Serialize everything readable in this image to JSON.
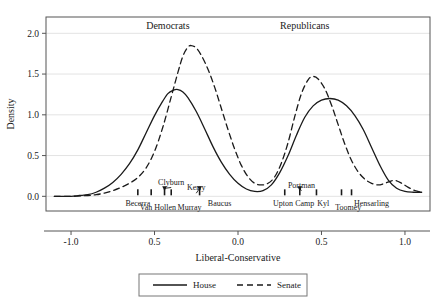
{
  "chart_data": {
    "type": "line",
    "title": "",
    "xlabel": "Liberal-Conservative",
    "ylabel": "Density",
    "xlim": [
      -1.15,
      1.15
    ],
    "ylim": [
      -0.18,
      2.2
    ],
    "grid": true,
    "legend_position": "bottom",
    "xticks": [
      -1.0,
      -0.5,
      0.0,
      0.5,
      1.0
    ],
    "xtick_labels": [
      "-1.0",
      "0.5",
      "0.0",
      "0.5",
      "1.0"
    ],
    "yticks": [
      0.0,
      0.5,
      1.0,
      1.5,
      2.0
    ],
    "ytick_labels": [
      "0.0",
      "0.5",
      "1.0",
      "1.5",
      "2.0"
    ],
    "panel_titles": [
      "Democrats",
      "Republicans"
    ],
    "series": [
      {
        "name": "House",
        "style": "solid",
        "color": "#1a1a1a",
        "points": [
          [
            -1.1,
            0.0
          ],
          [
            -1.0,
            0.0
          ],
          [
            -0.95,
            0.01
          ],
          [
            -0.9,
            0.02
          ],
          [
            -0.85,
            0.05
          ],
          [
            -0.8,
            0.1
          ],
          [
            -0.75,
            0.17
          ],
          [
            -0.7,
            0.27
          ],
          [
            -0.65,
            0.4
          ],
          [
            -0.6,
            0.57
          ],
          [
            -0.55,
            0.78
          ],
          [
            -0.5,
            0.99
          ],
          [
            -0.45,
            1.17
          ],
          [
            -0.42,
            1.26
          ],
          [
            -0.39,
            1.3
          ],
          [
            -0.36,
            1.31
          ],
          [
            -0.33,
            1.28
          ],
          [
            -0.3,
            1.21
          ],
          [
            -0.25,
            1.04
          ],
          [
            -0.2,
            0.83
          ],
          [
            -0.15,
            0.61
          ],
          [
            -0.1,
            0.42
          ],
          [
            -0.05,
            0.27
          ],
          [
            0.0,
            0.16
          ],
          [
            0.05,
            0.09
          ],
          [
            0.1,
            0.06
          ],
          [
            0.15,
            0.07
          ],
          [
            0.2,
            0.14
          ],
          [
            0.25,
            0.29
          ],
          [
            0.3,
            0.5
          ],
          [
            0.35,
            0.75
          ],
          [
            0.4,
            0.97
          ],
          [
            0.45,
            1.11
          ],
          [
            0.5,
            1.18
          ],
          [
            0.55,
            1.2
          ],
          [
            0.6,
            1.18
          ],
          [
            0.65,
            1.11
          ],
          [
            0.7,
            0.99
          ],
          [
            0.75,
            0.82
          ],
          [
            0.8,
            0.6
          ],
          [
            0.85,
            0.38
          ],
          [
            0.9,
            0.2
          ],
          [
            0.95,
            0.1
          ],
          [
            1.0,
            0.06
          ],
          [
            1.05,
            0.05
          ],
          [
            1.1,
            0.05
          ]
        ]
      },
      {
        "name": "Senate",
        "style": "dashed",
        "color": "#1a1a1a",
        "points": [
          [
            -1.1,
            0.0
          ],
          [
            -1.0,
            0.0
          ],
          [
            -0.9,
            0.01
          ],
          [
            -0.85,
            0.02
          ],
          [
            -0.8,
            0.04
          ],
          [
            -0.75,
            0.07
          ],
          [
            -0.7,
            0.11
          ],
          [
            -0.65,
            0.16
          ],
          [
            -0.6,
            0.23
          ],
          [
            -0.55,
            0.35
          ],
          [
            -0.5,
            0.55
          ],
          [
            -0.45,
            0.85
          ],
          [
            -0.4,
            1.22
          ],
          [
            -0.36,
            1.52
          ],
          [
            -0.33,
            1.72
          ],
          [
            -0.3,
            1.83
          ],
          [
            -0.28,
            1.85
          ],
          [
            -0.25,
            1.82
          ],
          [
            -0.22,
            1.73
          ],
          [
            -0.18,
            1.56
          ],
          [
            -0.14,
            1.34
          ],
          [
            -0.1,
            1.08
          ],
          [
            -0.06,
            0.82
          ],
          [
            -0.02,
            0.58
          ],
          [
            0.02,
            0.38
          ],
          [
            0.06,
            0.24
          ],
          [
            0.1,
            0.16
          ],
          [
            0.14,
            0.14
          ],
          [
            0.18,
            0.16
          ],
          [
            0.22,
            0.24
          ],
          [
            0.26,
            0.41
          ],
          [
            0.3,
            0.66
          ],
          [
            0.34,
            0.98
          ],
          [
            0.38,
            1.26
          ],
          [
            0.42,
            1.43
          ],
          [
            0.45,
            1.47
          ],
          [
            0.48,
            1.44
          ],
          [
            0.52,
            1.32
          ],
          [
            0.56,
            1.12
          ],
          [
            0.6,
            0.88
          ],
          [
            0.64,
            0.64
          ],
          [
            0.68,
            0.44
          ],
          [
            0.72,
            0.3
          ],
          [
            0.76,
            0.21
          ],
          [
            0.8,
            0.16
          ],
          [
            0.84,
            0.14
          ],
          [
            0.88,
            0.16
          ],
          [
            0.92,
            0.19
          ],
          [
            0.95,
            0.19
          ],
          [
            0.98,
            0.16
          ],
          [
            1.02,
            0.11
          ],
          [
            1.06,
            0.07
          ],
          [
            1.1,
            0.05
          ]
        ]
      }
    ],
    "rug_marks": [
      {
        "x": -0.6,
        "group": "Democrats"
      },
      {
        "x": -0.52,
        "group": "Democrats"
      },
      {
        "x": -0.44,
        "group": "Democrats"
      },
      {
        "x": -0.4,
        "group": "Democrats"
      },
      {
        "x": -0.23,
        "group": "Democrats"
      },
      {
        "x": 0.28,
        "group": "Republicans"
      },
      {
        "x": 0.37,
        "group": "Republicans"
      },
      {
        "x": 0.47,
        "group": "Republicans"
      },
      {
        "x": 0.62,
        "group": "Republicans"
      },
      {
        "x": 0.68,
        "group": "Republicans"
      }
    ],
    "annotations": [
      {
        "name": "Becerra",
        "x": -0.6,
        "label_x": -0.6,
        "label_y": -0.115,
        "arrow": false,
        "group": "Democrats"
      },
      {
        "name": "Van Hollen",
        "x": -0.52,
        "label_x": -0.48,
        "label_y": -0.165,
        "arrow": false,
        "group": "Democrats"
      },
      {
        "name": "Clyburn",
        "x": -0.44,
        "label_x": -0.4,
        "label_y": 0.145,
        "arrow": true,
        "group": "Democrats"
      },
      {
        "name": "Murray",
        "x": -0.4,
        "label_x": -0.29,
        "label_y": -0.165,
        "arrow": false,
        "group": "Democrats"
      },
      {
        "name": "Kerry",
        "x": -0.23,
        "label_x": -0.25,
        "label_y": 0.075,
        "arrow": true,
        "group": "Democrats"
      },
      {
        "name": "Baucus",
        "x": -0.23,
        "label_x": -0.11,
        "label_y": -0.115,
        "arrow": false,
        "group": "Democrats"
      },
      {
        "name": "Upton",
        "x": 0.28,
        "label_x": 0.27,
        "label_y": -0.115,
        "arrow": false,
        "group": "Republicans"
      },
      {
        "name": "Portman",
        "x": 0.37,
        "label_x": 0.38,
        "label_y": 0.105,
        "arrow": true,
        "group": "Republicans"
      },
      {
        "name": "Camp",
        "x": 0.37,
        "label_x": 0.4,
        "label_y": -0.115,
        "arrow": false,
        "group": "Republicans"
      },
      {
        "name": "Kyl",
        "x": 0.47,
        "label_x": 0.51,
        "label_y": -0.115,
        "arrow": false,
        "group": "Republicans"
      },
      {
        "name": "Toomey",
        "x": 0.62,
        "label_x": 0.66,
        "label_y": -0.168,
        "arrow": false,
        "group": "Republicans"
      },
      {
        "name": "Hensarling",
        "x": 0.68,
        "label_x": 0.8,
        "label_y": -0.115,
        "arrow": false,
        "group": "Republicans"
      }
    ],
    "legend": [
      {
        "label": "House",
        "style": "solid"
      },
      {
        "label": "Senate",
        "style": "dashed"
      }
    ]
  }
}
